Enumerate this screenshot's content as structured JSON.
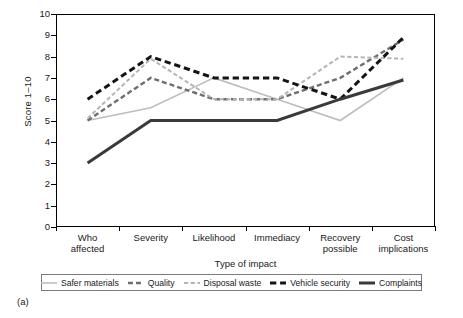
{
  "figure": {
    "caption": "(a)"
  },
  "axes": {
    "ylabel": "Score 1–10",
    "xlabel": "Type of impact",
    "yticks": [
      "0",
      "1",
      "2",
      "3",
      "4",
      "5",
      "6",
      "7",
      "8",
      "9",
      "10"
    ]
  },
  "legend": {
    "items": [
      {
        "label": "Safer materials",
        "color": "#bdbdbd",
        "style": "solid",
        "width": 1.6
      },
      {
        "label": "Quality",
        "color": "#6e6e6e",
        "style": "dashed",
        "width": 2.4
      },
      {
        "label": "Disposal waste",
        "color": "#b5b5b5",
        "style": "dashed",
        "width": 2.0
      },
      {
        "label": "Vehicle security",
        "color": "#141414",
        "style": "dashed",
        "width": 3.0
      },
      {
        "label": "Complaints",
        "color": "#3a3a3a",
        "style": "solid",
        "width": 3.0
      }
    ]
  },
  "chart_data": {
    "type": "line",
    "title": "",
    "xlabel": "Type of impact",
    "ylabel": "Score 1–10",
    "ylim": [
      0,
      10
    ],
    "ytick_step": 1,
    "grid": false,
    "legend_position": "bottom",
    "categories": [
      "Who affected",
      "Severity",
      "Likelihood",
      "Immediacy",
      "Recovery possible",
      "Cost implications"
    ],
    "category_lines": [
      [
        "Who",
        "affected"
      ],
      [
        "Severity"
      ],
      [
        "Likelihood"
      ],
      [
        "Immediacy"
      ],
      [
        "Recovery",
        "possible"
      ],
      [
        "Cost",
        "implications"
      ]
    ],
    "series": [
      {
        "name": "Safer materials",
        "color": "#bdbdbd",
        "style": "solid",
        "width": 1.6,
        "values": [
          5.0,
          5.6,
          7.0,
          6.0,
          5.0,
          7.0
        ]
      },
      {
        "name": "Quality",
        "color": "#6e6e6e",
        "style": "dashed",
        "width": 2.4,
        "values": [
          5.0,
          7.0,
          6.0,
          6.0,
          7.0,
          8.8
        ]
      },
      {
        "name": "Disposal waste",
        "color": "#b5b5b5",
        "style": "dashed",
        "width": 2.0,
        "values": [
          5.1,
          7.9,
          6.0,
          6.0,
          8.0,
          7.9
        ]
      },
      {
        "name": "Vehicle security",
        "color": "#141414",
        "style": "dashed",
        "width": 3.0,
        "values": [
          6.0,
          8.0,
          7.0,
          7.0,
          6.0,
          8.9
        ]
      },
      {
        "name": "Complaints",
        "color": "#3a3a3a",
        "style": "solid",
        "width": 3.0,
        "values": [
          3.0,
          5.0,
          5.0,
          5.0,
          6.0,
          6.9
        ]
      }
    ]
  }
}
